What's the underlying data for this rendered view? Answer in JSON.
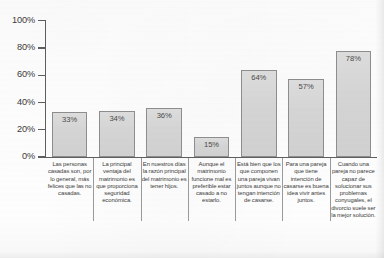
{
  "chart_data": {
    "type": "bar",
    "title": "",
    "subtitle": "",
    "xlabel": "",
    "ylabel": "",
    "ylim": [
      0,
      100
    ],
    "y_tick_labels": [
      "100%",
      "80%",
      "60%",
      "40%",
      "20%",
      "0%"
    ],
    "y_tick_values": [
      100,
      80,
      60,
      40,
      20,
      0
    ],
    "grid": false,
    "legend": null,
    "value_label_format": "percent",
    "categories": [
      "Las personas casadas son, por lo general, más felices que las no casadas.",
      "La principal ventaja del matrimonio es que proporciona seguridad económica.",
      "En nuestros días la razón principal del matrimonio es tener hijos.",
      "Aunque el matrimonio funcione mal es preferible estar casado a no estarlo.",
      "Está bien que los que componen una pareja vivan juntos aunque no tengan intención de casarse.",
      "Para una pareja que tiene intención de casarse es buena idea vivir antes juntos.",
      "Cuando una pareja no parece capaz de solucionar sus problemas conyugales, el divorcio suele ser la mejor solución."
    ],
    "values": [
      33,
      34,
      36,
      15,
      64,
      57,
      78
    ],
    "value_labels": [
      "33%",
      "34%",
      "36%",
      "15%",
      "64%",
      "57%",
      "78%"
    ]
  },
  "style": {
    "bar_fill": "#d6d6d6",
    "bar_border": "#8d8d8d",
    "axis_color": "#5e5e5e",
    "text_color": "#3c3c3c",
    "background": "#fdfdfd"
  }
}
